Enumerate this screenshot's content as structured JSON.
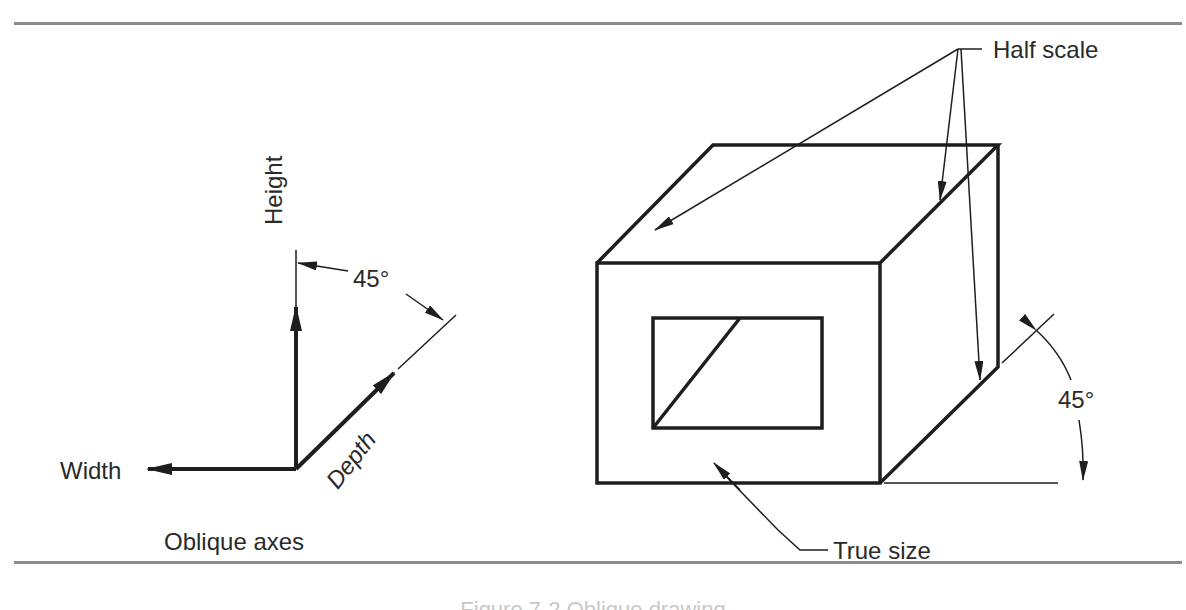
{
  "figure": {
    "caption": "Figure 7-2  Oblique drawing",
    "left_panel": {
      "title": "Oblique axes",
      "axes": {
        "height_label": "Height",
        "width_label": "Width",
        "depth_label": "Depth",
        "angle_label": "45°"
      }
    },
    "right_panel": {
      "callouts": {
        "half_scale": "Half scale",
        "true_size": "True size",
        "angle": "45°"
      }
    },
    "colors": {
      "line": "#1e1e1e",
      "rule": "#8c8c8c",
      "background": "#ffffff"
    }
  }
}
